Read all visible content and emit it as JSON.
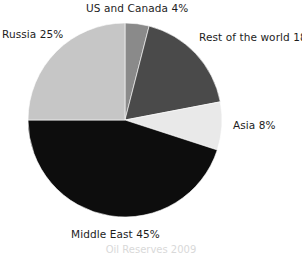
{
  "chart_data": {
    "type": "pie",
    "title": "",
    "subtitle": "",
    "xlabel": "",
    "ylabel": "",
    "legend_position": "none",
    "grid": false,
    "labels_inline": true,
    "categories": [
      "US and Canada",
      "Rest of the world",
      "Asia",
      "Middle East",
      "Russia"
    ],
    "values": [
      4,
      18,
      8,
      45,
      25
    ],
    "value_unit": "%",
    "slices": [
      {
        "label": "US and Canada",
        "value": 4,
        "display": "US and Canada 4%",
        "color": "#8a8a8a"
      },
      {
        "label": "Rest of the world",
        "value": 18,
        "display": "Rest of the world 18%",
        "color": "#4a4a4a"
      },
      {
        "label": "Asia",
        "value": 8,
        "display": "Asia 8%",
        "color": "#e9e9e9"
      },
      {
        "label": "Middle East",
        "value": 45,
        "display": "Middle East 45%",
        "color": "#0d0d0d"
      },
      {
        "label": "Russia",
        "value": 25,
        "display": "Russia 25%",
        "color": "#c6c6c6"
      }
    ],
    "start_angle_deg": 0,
    "direction": "clockwise",
    "annotations": []
  },
  "labels": {
    "us_canada": "US and Canada 4%",
    "rest_of_world": "Rest of the world 18%",
    "asia": "Asia 8%",
    "middle_east": "Middle East 45%",
    "russia": "Russia 25%"
  },
  "caption": {
    "cut_off_text": "Oil Reserves 2009"
  },
  "colors": {
    "background": "#ffffff",
    "text": "#1d1d1d",
    "slice_us_canada": "#8a8a8a",
    "slice_rest_of_world": "#4a4a4a",
    "slice_asia": "#e9e9e9",
    "slice_middle_east": "#0d0d0d",
    "slice_russia": "#c6c6c6"
  }
}
